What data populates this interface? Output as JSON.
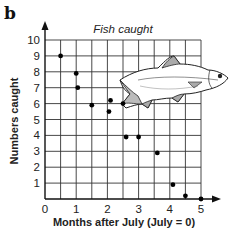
{
  "panel_label": "b",
  "chart_data": {
    "type": "scatter",
    "title": "Fish caught",
    "xlabel": "Months after July (July = 0)",
    "ylabel": "Numbers caught",
    "xlim": [
      0,
      5
    ],
    "ylim": [
      0,
      10
    ],
    "x_ticks": [
      "0",
      "1",
      "2",
      "3",
      "4",
      "5"
    ],
    "y_ticks": [
      "1",
      "2",
      "3",
      "4",
      "5",
      "6",
      "7",
      "8",
      "9",
      "10"
    ],
    "grid": true,
    "x_grid_step": 0.5,
    "y_grid_step": 1,
    "illustration": "fish",
    "points": [
      {
        "x": 0.5,
        "y": 9
      },
      {
        "x": 1.0,
        "y": 7.9
      },
      {
        "x": 1.05,
        "y": 7
      },
      {
        "x": 1.5,
        "y": 5.9
      },
      {
        "x": 2.05,
        "y": 5.5
      },
      {
        "x": 2.1,
        "y": 6.2
      },
      {
        "x": 2.5,
        "y": 6
      },
      {
        "x": 2.6,
        "y": 3.9
      },
      {
        "x": 3.0,
        "y": 3.9
      },
      {
        "x": 3.6,
        "y": 2.9
      },
      {
        "x": 4.1,
        "y": 0.9
      },
      {
        "x": 4.5,
        "y": 0.2
      },
      {
        "x": 5.0,
        "y": 0
      }
    ]
  }
}
